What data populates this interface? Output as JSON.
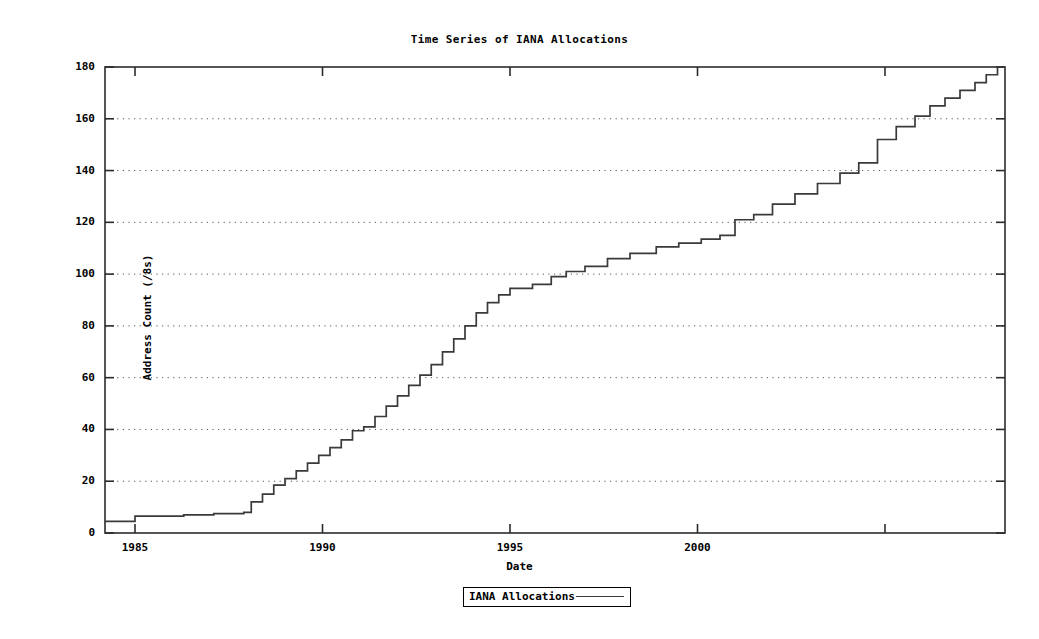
{
  "chart_data": {
    "type": "line",
    "title": "Time Series of IANA Allocations",
    "xlabel": "Date",
    "ylabel": "Address Count (/8s)",
    "legend": [
      {
        "name": "IANA Allocations",
        "style": "step-line",
        "color": "#3a3a3a"
      }
    ],
    "legend_position": "bottom-center",
    "grid": "horizontal-dotted",
    "xlim": [
      1984.2,
      2008.2
    ],
    "ylim": [
      0,
      180
    ],
    "xticks": [
      1985,
      1990,
      1995,
      2000,
      2005
    ],
    "xtick_labels": [
      "1985",
      "1990",
      "1995",
      "2000",
      ""
    ],
    "yticks": [
      0,
      20,
      40,
      60,
      80,
      100,
      120,
      140,
      160,
      180
    ],
    "ytick_labels": [
      "0",
      "20",
      "40",
      "60",
      "80",
      "100",
      "120",
      "140",
      "160",
      "180"
    ],
    "x": [
      1984.2,
      1985.0,
      1985.0,
      1986.3,
      1986.3,
      1987.1,
      1987.1,
      1987.9,
      1987.9,
      1988.1,
      1988.1,
      1988.4,
      1988.4,
      1988.7,
      1988.7,
      1989.0,
      1989.0,
      1989.3,
      1989.3,
      1989.6,
      1989.6,
      1989.9,
      1989.9,
      1990.2,
      1990.2,
      1990.5,
      1990.5,
      1990.8,
      1990.8,
      1991.1,
      1991.1,
      1991.4,
      1991.4,
      1991.7,
      1991.7,
      1992.0,
      1992.0,
      1992.3,
      1992.3,
      1992.6,
      1992.6,
      1992.9,
      1992.9,
      1993.2,
      1993.2,
      1993.5,
      1993.5,
      1993.8,
      1993.8,
      1994.1,
      1994.1,
      1994.4,
      1994.4,
      1994.7,
      1994.7,
      1995.0,
      1995.0,
      1995.6,
      1995.6,
      1996.1,
      1996.1,
      1996.5,
      1996.5,
      1997.0,
      1997.0,
      1997.6,
      1997.6,
      1998.2,
      1998.2,
      1998.9,
      1998.9,
      1999.5,
      1999.5,
      2000.1,
      2000.1,
      2000.6,
      2000.6,
      2001.0,
      2001.0,
      2001.5,
      2001.5,
      2002.0,
      2002.0,
      2002.6,
      2002.6,
      2003.2,
      2003.2,
      2003.8,
      2003.8,
      2004.3,
      2004.3,
      2004.8,
      2004.8,
      2005.3,
      2005.3,
      2005.8,
      2005.8,
      2006.2,
      2006.2,
      2006.6,
      2006.6,
      2007.0,
      2007.0,
      2007.4,
      2007.4,
      2007.7,
      2007.7,
      2008.0,
      2008.0,
      2008.2
    ],
    "y": [
      4.5,
      4.5,
      6.5,
      6.5,
      7.0,
      7.0,
      7.5,
      7.5,
      8.0,
      8.0,
      12.0,
      12.0,
      15.0,
      15.0,
      18.5,
      18.5,
      21.0,
      21.0,
      24.0,
      24.0,
      27.0,
      27.0,
      30.0,
      30.0,
      33.0,
      33.0,
      36.0,
      36.0,
      39.5,
      39.5,
      41.0,
      41.0,
      45.0,
      45.0,
      49.0,
      49.0,
      53.0,
      53.0,
      57.0,
      57.0,
      61.0,
      61.0,
      65.0,
      65.0,
      70.0,
      70.0,
      75.0,
      75.0,
      80.0,
      80.0,
      85.0,
      85.0,
      89.0,
      89.0,
      92.0,
      92.0,
      94.5,
      94.5,
      96.0,
      96.0,
      99.0,
      99.0,
      101.0,
      101.0,
      103.0,
      103.0,
      106.0,
      106.0,
      108.0,
      108.0,
      110.5,
      110.5,
      112.0,
      112.0,
      113.5,
      113.5,
      115.0,
      115.0,
      121.0,
      121.0,
      123.0,
      123.0,
      127.0,
      127.0,
      131.0,
      131.0,
      135.0,
      135.0,
      139.0,
      139.0,
      143.0,
      143.0,
      152.0,
      152.0,
      157.0,
      157.0,
      161.0,
      161.0,
      165.0,
      165.0,
      168.0,
      168.0,
      171.0,
      171.0,
      174.0,
      174.0,
      177.0,
      177.0,
      180.0,
      180.0
    ]
  }
}
